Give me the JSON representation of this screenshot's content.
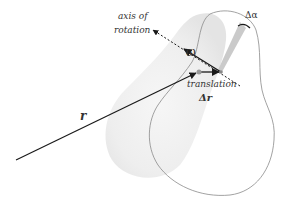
{
  "diagram": {
    "labels": {
      "axis_line1": "axis of",
      "axis_line2": "rotation",
      "omega": "ω",
      "delta_alpha": "Δα",
      "translation": "translation",
      "delta_r": "Δr",
      "r": "r"
    },
    "colors": {
      "line": "#1a1a1a",
      "text": "#333333",
      "ghost_body": "#ececec",
      "outline": "#8a8a8a",
      "wedge": "#bdbdbd"
    }
  }
}
